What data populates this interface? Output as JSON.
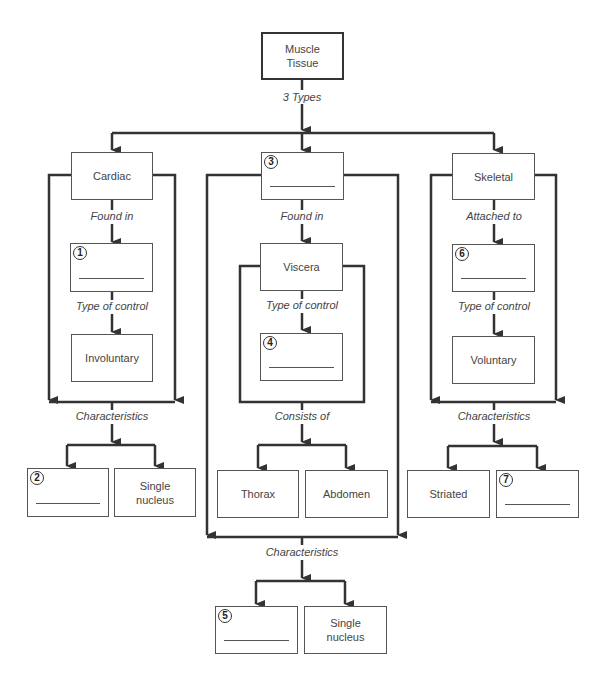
{
  "root": {
    "label": "Muscle Tissue",
    "line1": "Muscle",
    "line2": "Tissue"
  },
  "edge_labels": {
    "types": "3 Types",
    "cardiac_found": "Found in",
    "cardiac_control": "Type of control",
    "cardiac_char": "Characteristics",
    "smooth_found": "Found in",
    "smooth_control": "Type of control",
    "smooth_consists": "Consists of",
    "smooth_char": "Characteristics",
    "skeletal_attached": "Attached to",
    "skeletal_control": "Type of control",
    "skeletal_char": "Characteristics"
  },
  "cardiac": {
    "title": "Cardiac",
    "found_in_blank": "1",
    "control": "Involuntary",
    "char_blank": "2",
    "char2_line1": "Single",
    "char2_line2": "nucleus"
  },
  "smooth": {
    "title_blank": "3",
    "found_in": "Viscera",
    "control_blank": "4",
    "consists": [
      "Thorax",
      "Abdomen"
    ],
    "char_blank": "5",
    "char2_line1": "Single",
    "char2_line2": "nucleus"
  },
  "skeletal": {
    "title": "Skeletal",
    "attached_blank": "6",
    "control": "Voluntary",
    "char1": "Striated",
    "char_blank": "7"
  },
  "colors": {
    "line": "#333333",
    "box_border": "#555555",
    "text": "#444444"
  }
}
